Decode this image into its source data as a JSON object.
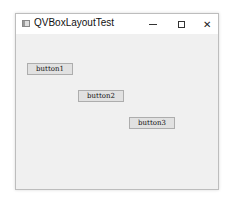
{
  "window": {
    "title": "QVBoxLayoutTest",
    "controls": {
      "minimize": "—",
      "maximize": "☐",
      "close": "✕"
    }
  },
  "buttons": [
    {
      "label": "button1"
    },
    {
      "label": "button2"
    },
    {
      "label": "button3"
    }
  ]
}
